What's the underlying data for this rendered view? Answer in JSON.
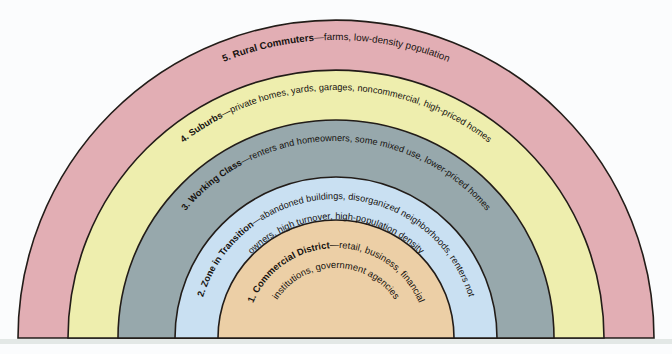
{
  "figure": {
    "type": "concentric-zone-diagram",
    "background_color": "#fbfcfd",
    "outline_color": "#221c18",
    "baseline_shadow_color": "#e3e8e6"
  },
  "zones": [
    {
      "number": "1.",
      "name": "Commercial District",
      "dash": "—",
      "description": "retail, business, financial institutions, government agencies",
      "description_line1": "retail, business, financial",
      "description_line2": "institutions, government agencies",
      "full_label": "1. Commercial District—retail, business, financial institutions, government agencies",
      "color": "#eccfa6",
      "outer_radius": 118,
      "inner_radius": 0,
      "ring_index": 1
    },
    {
      "number": "2.",
      "name": "Zone in Transition",
      "dash": "—",
      "description": "abandoned buildings, disorganized neighborhoods, renters not owners, high turnover, high-population density",
      "description_line1": "abandoned buildings, disorganized neighborhoods, renters not",
      "description_line2": "owners, high turnover, high-population density",
      "full_label": "2. Zone in Transition—abandoned buildings, disorganized neighborhoods, renters not owners, high turnover, high-population density",
      "color": "#c9e0f2",
      "outer_radius": 161,
      "inner_radius": 118,
      "ring_index": 2
    },
    {
      "number": "3.",
      "name": "Working Class",
      "dash": "—",
      "description": "renters and homeowners, some mixed use, lower-priced homes",
      "description_line1": "renters and homeowners, some mixed use, lower-priced homes",
      "description_line2": "",
      "full_label": "3. Working Class—renters and homeowners, some mixed use, lower-priced homes",
      "color": "#97a8ac",
      "outer_radius": 218,
      "inner_radius": 161,
      "ring_index": 3
    },
    {
      "number": "4.",
      "name": "Suburbs",
      "dash": "—",
      "description": "private homes, yards, garages, noncommercial, high-priced homes",
      "description_line1": "private homes, yards, garages, noncommercial, high-priced homes",
      "description_line2": "",
      "full_label": "4. Suburbs—private homes, yards, garages, noncommercial, high-priced homes",
      "color": "#eeeeae",
      "outer_radius": 268,
      "inner_radius": 218,
      "ring_index": 4
    },
    {
      "number": "5.",
      "name": "Rural Commuters",
      "dash": "—",
      "description": "farms, low-density population",
      "description_line1": "farms, low-density population",
      "description_line2": "",
      "full_label": "5. Rural Commuters—farms, low-density population",
      "color": "#e2aeb4",
      "outer_radius": 318,
      "inner_radius": 268,
      "ring_index": 5
    }
  ],
  "geometry": {
    "center_x": 336,
    "center_y": 338,
    "max_radius": 318,
    "shape": "semicircle"
  }
}
